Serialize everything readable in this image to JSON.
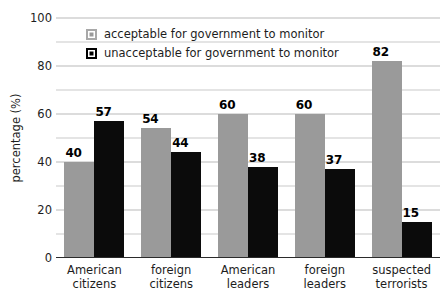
{
  "chart_data": {
    "type": "bar",
    "title": "",
    "subtitle": "",
    "xlabel": "",
    "ylabel": "percentage (%)",
    "ylim": [
      0,
      100
    ],
    "ytick_major": [
      0,
      20,
      40,
      60,
      80,
      100
    ],
    "ytick_minor": [
      10,
      30,
      50,
      70,
      90
    ],
    "ytick_labels": [
      "0",
      "20",
      "40",
      "60",
      "80",
      "100"
    ],
    "grid": true,
    "grid_axis": "y",
    "legend_position": "upper-left-inside",
    "categories": [
      "American citizens",
      "foreign citizens",
      "American leaders",
      "foreign leaders",
      "suspected terrorists"
    ],
    "category_lines": [
      [
        "American",
        "citizens"
      ],
      [
        "foreign",
        "citizens"
      ],
      [
        "American",
        "leaders"
      ],
      [
        "foreign",
        "leaders"
      ],
      [
        "suspected",
        "terrorists"
      ]
    ],
    "series": [
      {
        "name": "acceptable for government to monitor",
        "color": "#9a9a9a",
        "values": [
          40,
          54,
          60,
          60,
          82
        ],
        "labels": [
          "40",
          "54",
          "60",
          "60",
          "82"
        ]
      },
      {
        "name": "unacceptable for government to monitor",
        "color": "#0b0b0b",
        "values": [
          57,
          44,
          38,
          37,
          15
        ],
        "labels": [
          "57",
          "44",
          "38",
          "37",
          "15"
        ]
      }
    ]
  },
  "legend": {
    "items": [
      {
        "label": "acceptable for government to monitor",
        "swatch": "acceptable"
      },
      {
        "label": "unacceptable for government to monitor",
        "swatch": "unacceptable"
      }
    ]
  },
  "colors": {
    "acceptable": "#9a9a9a",
    "unacceptable": "#0b0b0b",
    "gridline": "#b9b9b9",
    "axis": "#2b2b2b",
    "text": "#1d1d1d",
    "background": "#ffffff"
  }
}
